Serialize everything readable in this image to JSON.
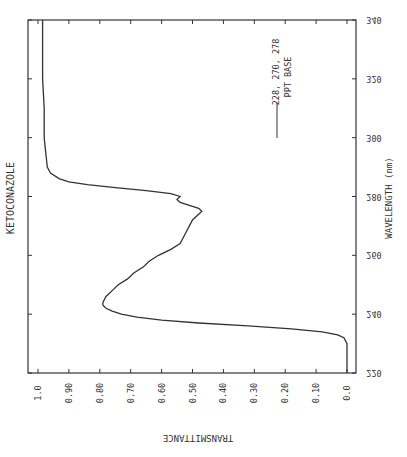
{
  "chart_data": {
    "type": "line",
    "title": "KETOCONAZOLE",
    "xlabel": "WAVELENGTH (nm)",
    "ylabel": "TRANSMITTANCE",
    "orientation": "rotated 90deg; wavelength on vertical axis (220 bottom to 340 top), transmittance on horizontal axis (1.0 left to 0.0 right)",
    "xlim": [
      220,
      340
    ],
    "ylim": [
      0.0,
      1.0
    ],
    "x_ticks": [
      220,
      240,
      260,
      280,
      300,
      320,
      340
    ],
    "y_ticks": [
      "1.0",
      "0.90",
      "0.80",
      "0.70",
      "0.60",
      "0.50",
      "0.40",
      "0.30",
      "0.20",
      "0.10",
      "0.0"
    ],
    "grid": false,
    "legend": {
      "entries": [
        {
          "label_line1": "228, 270, 278",
          "label_line2": "PPT BASE"
        }
      ],
      "position": "upper-right inside plot"
    },
    "series": [
      {
        "name": "PPT BASE",
        "x": [
          220,
          225,
          230,
          232,
          233,
          234,
          235,
          236,
          237,
          238,
          239,
          240,
          241,
          242,
          243,
          244,
          246,
          248,
          250,
          252,
          254,
          256,
          258,
          260,
          262,
          264,
          266,
          268,
          270,
          272,
          274,
          275,
          276,
          277,
          278,
          279,
          280,
          281,
          282,
          283,
          284,
          285,
          286,
          288,
          290,
          295,
          300,
          310,
          320,
          330,
          340
        ],
        "values": [
          0.0,
          0.0,
          0.0,
          0.01,
          0.03,
          0.08,
          0.18,
          0.32,
          0.48,
          0.6,
          0.68,
          0.73,
          0.76,
          0.78,
          0.79,
          0.79,
          0.78,
          0.76,
          0.74,
          0.71,
          0.69,
          0.66,
          0.64,
          0.61,
          0.57,
          0.54,
          0.53,
          0.52,
          0.51,
          0.5,
          0.48,
          0.47,
          0.48,
          0.51,
          0.54,
          0.55,
          0.54,
          0.57,
          0.65,
          0.75,
          0.84,
          0.9,
          0.93,
          0.96,
          0.97,
          0.975,
          0.98,
          0.98,
          0.985,
          0.985,
          0.985
        ]
      }
    ]
  }
}
